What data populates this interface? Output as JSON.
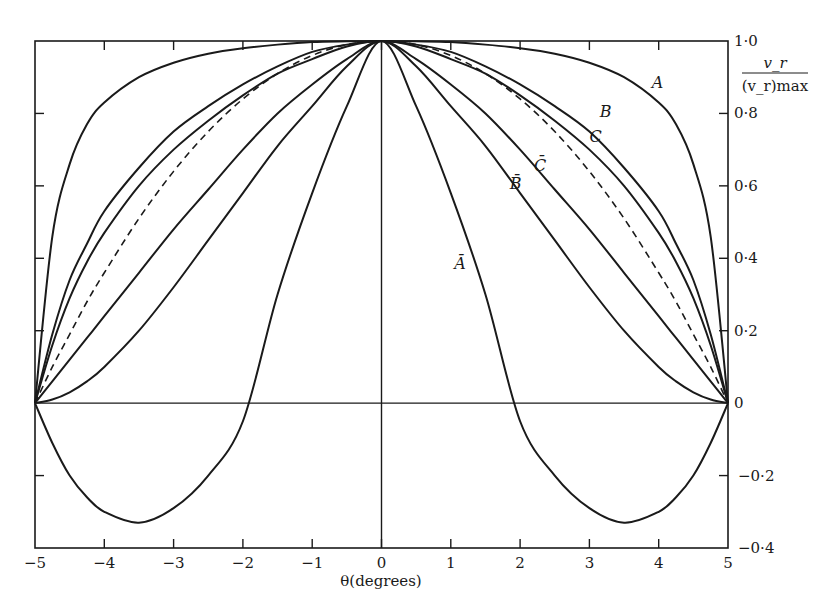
{
  "chart_data": {
    "type": "line",
    "title": "",
    "xlabel": "θ(degrees)",
    "ylabel_numerator": "v_r",
    "ylabel_denominator": "(v_r)max",
    "xlim": [
      -5,
      5
    ],
    "ylim": [
      -0.4,
      1.0
    ],
    "x_ticks": [
      -5,
      -4,
      -3,
      -2,
      -1,
      0,
      1,
      2,
      3,
      4,
      5
    ],
    "x_tick_labels": [
      "−5",
      "−4",
      "−3",
      "−2",
      "−1",
      "0",
      "1",
      "2",
      "3",
      "4",
      "5"
    ],
    "y_ticks": [
      1.0,
      0.8,
      0.6,
      0.4,
      0.2,
      0,
      -0.2,
      -0.4
    ],
    "y_tick_labels": [
      "1·0",
      "0·8",
      "0·6",
      "0·4",
      "0·2",
      "0",
      "−0·2",
      "−0·4"
    ],
    "grid": false,
    "y_axis_position": "right",
    "legend": "inline curve labels",
    "symmetric_about_zero": true,
    "x": [
      0,
      0.5,
      1,
      1.5,
      2,
      2.5,
      3,
      3.5,
      4,
      4.25,
      4.5,
      4.75,
      5
    ],
    "series": [
      {
        "name": "A",
        "style": "solid",
        "values": [
          1.0,
          0.999,
          0.997,
          0.99,
          0.98,
          0.965,
          0.94,
          0.9,
          0.83,
          0.77,
          0.66,
          0.46,
          0.0
        ]
      },
      {
        "name": "B",
        "style": "solid",
        "values": [
          1.0,
          0.99,
          0.97,
          0.93,
          0.88,
          0.82,
          0.75,
          0.65,
          0.53,
          0.44,
          0.34,
          0.19,
          0.0
        ]
      },
      {
        "name": "C",
        "style": "solid",
        "values": [
          1.0,
          0.985,
          0.95,
          0.91,
          0.85,
          0.78,
          0.7,
          0.6,
          0.47,
          0.39,
          0.29,
          0.16,
          0.0
        ]
      },
      {
        "name": "dashed",
        "style": "dashed",
        "values": [
          1.0,
          0.99,
          0.96,
          0.91,
          0.84,
          0.75,
          0.64,
          0.51,
          0.36,
          0.28,
          0.19,
          0.1,
          0.0
        ]
      },
      {
        "name": "C̄",
        "style": "solid",
        "values": [
          1.0,
          0.95,
          0.88,
          0.8,
          0.7,
          0.59,
          0.48,
          0.36,
          0.24,
          0.18,
          0.12,
          0.06,
          0.0
        ]
      },
      {
        "name": "B̄",
        "style": "solid",
        "values": [
          1.0,
          0.93,
          0.82,
          0.71,
          0.58,
          0.45,
          0.32,
          0.2,
          0.1,
          0.06,
          0.03,
          0.01,
          0.0
        ]
      },
      {
        "name": "Ā",
        "style": "solid",
        "values": [
          1.0,
          0.82,
          0.58,
          0.3,
          -0.05,
          -0.2,
          -0.29,
          -0.33,
          -0.3,
          -0.26,
          -0.2,
          -0.11,
          0.0
        ]
      }
    ],
    "curve_labels": [
      {
        "text": "A",
        "x": 3.9,
        "y": 0.87
      },
      {
        "text": "B",
        "x": 3.15,
        "y": 0.79
      },
      {
        "text": "C",
        "x": 3.0,
        "y": 0.72
      },
      {
        "text": "C̄",
        "x": 2.2,
        "y": 0.64
      },
      {
        "text": "B̄",
        "x": 1.85,
        "y": 0.59
      },
      {
        "text": "Ā",
        "x": 1.05,
        "y": 0.37
      }
    ]
  }
}
